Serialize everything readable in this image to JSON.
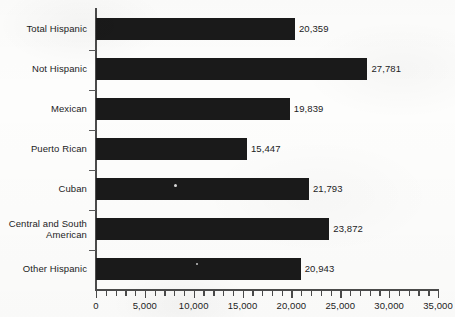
{
  "chart_data": {
    "type": "bar",
    "orientation": "horizontal",
    "title": "",
    "xlabel": "",
    "ylabel": "",
    "categories": [
      "Total Hispanic",
      "Not Hispanic",
      "Mexican",
      "Puerto Rican",
      "Cuban",
      "Central and South American",
      "Other Hispanic"
    ],
    "category_lines": [
      [
        "Total Hispanic"
      ],
      [
        "Not Hispanic"
      ],
      [
        "Mexican"
      ],
      [
        "Puerto Rican"
      ],
      [
        "Cuban"
      ],
      [
        "Central and South",
        "American"
      ],
      [
        "Other Hispanic"
      ]
    ],
    "values": [
      20359,
      27781,
      19839,
      15447,
      21793,
      23872,
      20943
    ],
    "value_labels": [
      "20,359",
      "27,781",
      "19,839",
      "15,447",
      "21,793",
      "23,872",
      "20,943"
    ],
    "xlim": [
      0,
      35000
    ],
    "xticks": [
      0,
      5000,
      10000,
      15000,
      20000,
      25000,
      30000,
      35000
    ],
    "xtick_labels": [
      "0",
      "5,000",
      "10,000",
      "15,000",
      "20,000",
      "25,000",
      "30,000",
      "35,000"
    ],
    "minor_tick_interval": 1000,
    "grid": false,
    "legend": false,
    "bar_color": "#1a1a1a",
    "axis_color": "#4b4b4b",
    "background_color": "#fdfdfc"
  }
}
